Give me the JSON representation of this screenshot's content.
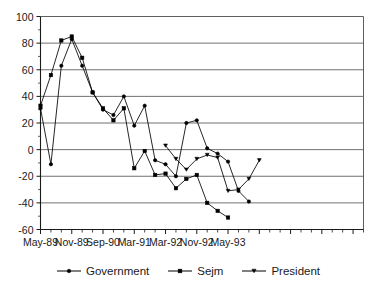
{
  "chart_data": {
    "type": "line",
    "title": "",
    "subtitle": "",
    "xlabel": "",
    "ylabel": "",
    "ylim": [
      -60,
      100
    ],
    "ytick_values": [
      100,
      80,
      60,
      40,
      20,
      0,
      -20,
      -40,
      -60
    ],
    "ytick_labels": [
      "100",
      "80",
      "60",
      "40",
      "20",
      "0",
      "-20",
      "-40",
      "-60"
    ],
    "grid": "horizontal",
    "legend_position": "bottom",
    "x_index_count": 32,
    "xtick_labels": [
      {
        "index": 0,
        "label": "May-89"
      },
      {
        "index": 3,
        "label": "Nov-89"
      },
      {
        "index": 6,
        "label": "Sep-90"
      },
      {
        "index": 9,
        "label": "Mar-91"
      },
      {
        "index": 12,
        "label": "Mar-92"
      },
      {
        "index": 15,
        "label": "Nov-92"
      },
      {
        "index": 18,
        "label": "May-93"
      }
    ],
    "series": [
      {
        "name": "Government",
        "marker": "circle",
        "color": "#000000",
        "points": [
          {
            "x": 0,
            "y": 31
          },
          {
            "x": 1,
            "y": -11
          },
          {
            "x": 2,
            "y": 63
          },
          {
            "x": 3,
            "y": 83
          },
          {
            "x": 4,
            "y": 63
          },
          {
            "x": 5,
            "y": 43
          },
          {
            "x": 6,
            "y": 30
          },
          {
            "x": 7,
            "y": 26
          },
          {
            "x": 8,
            "y": 40
          },
          {
            "x": 9,
            "y": 18
          },
          {
            "x": 10,
            "y": 33
          },
          {
            "x": 11,
            "y": -8
          },
          {
            "x": 12,
            "y": -11
          },
          {
            "x": 13,
            "y": -20
          },
          {
            "x": 14,
            "y": 20
          },
          {
            "x": 15,
            "y": 22
          },
          {
            "x": 16,
            "y": 1
          },
          {
            "x": 17,
            "y": -3
          },
          {
            "x": 18,
            "y": -9
          },
          {
            "x": 19,
            "y": -31
          },
          {
            "x": 20,
            "y": -39
          }
        ]
      },
      {
        "name": "Sejm",
        "marker": "square",
        "color": "#000000",
        "points": [
          {
            "x": 0,
            "y": 33
          },
          {
            "x": 1,
            "y": 56
          },
          {
            "x": 2,
            "y": 82
          },
          {
            "x": 3,
            "y": 85
          },
          {
            "x": 4,
            "y": 69
          },
          {
            "x": 5,
            "y": 43
          },
          {
            "x": 6,
            "y": 31
          },
          {
            "x": 7,
            "y": 22
          },
          {
            "x": 8,
            "y": 31
          },
          {
            "x": 9,
            "y": -14
          },
          {
            "x": 10,
            "y": -1
          },
          {
            "x": 11,
            "y": -19
          },
          {
            "x": 12,
            "y": -18
          },
          {
            "x": 13,
            "y": -29
          },
          {
            "x": 14,
            "y": -22
          },
          {
            "x": 15,
            "y": -19
          },
          {
            "x": 16,
            "y": -40
          },
          {
            "x": 17,
            "y": -46
          },
          {
            "x": 18,
            "y": -51
          }
        ]
      },
      {
        "name": "President",
        "marker": "triangle-down",
        "color": "#000000",
        "points": [
          {
            "x": 12,
            "y": 3
          },
          {
            "x": 13,
            "y": -7
          },
          {
            "x": 14,
            "y": -15
          },
          {
            "x": 15,
            "y": -7
          },
          {
            "x": 16,
            "y": -4
          },
          {
            "x": 17,
            "y": -6
          },
          {
            "x": 18,
            "y": -31
          },
          {
            "x": 19,
            "y": -30
          },
          {
            "x": 20,
            "y": -22
          },
          {
            "x": 21,
            "y": -8
          }
        ]
      }
    ]
  },
  "legend": {
    "items": [
      {
        "label": "Government",
        "marker": "circle"
      },
      {
        "label": "Sejm",
        "marker": "square"
      },
      {
        "label": "President",
        "marker": "triangle-down"
      }
    ]
  }
}
